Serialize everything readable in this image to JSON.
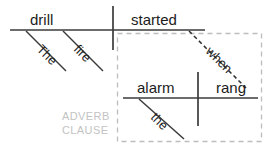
{
  "diagram": {
    "type": "sentence-diagram",
    "sentence": "The fire drill started when the alarm rang.",
    "main_clause": {
      "subject": "drill",
      "verb": "started",
      "subject_modifiers": [
        {
          "word": "The",
          "attaches_to": "drill"
        },
        {
          "word": "fire",
          "attaches_to": "drill"
        }
      ]
    },
    "subordinate_clause": {
      "label_line1": "ADVERB",
      "label_line2": "CLAUSE",
      "subject": "alarm",
      "verb": "rang",
      "subordinator": "when",
      "subject_modifiers": [
        {
          "word": "the",
          "attaches_to": "alarm"
        }
      ]
    },
    "colors": {
      "line": "#3b3b3b",
      "text": "#1c1c1c",
      "clause_box": "#bdbdbd",
      "clause_label": "#c3c3c3",
      "background": "#ffffff"
    }
  }
}
